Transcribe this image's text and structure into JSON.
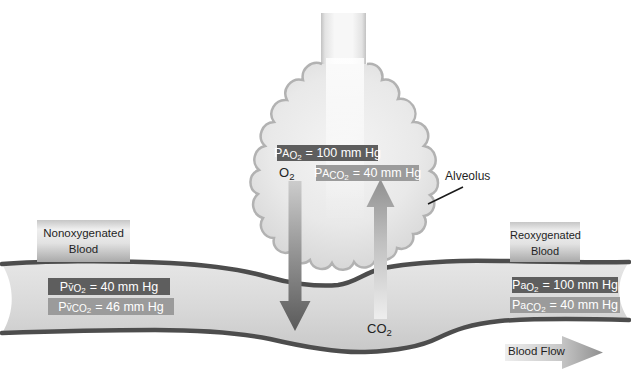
{
  "alveolus": {
    "label": "Alveolus",
    "po2_badge": {
      "p": "P",
      "mod": "A",
      "gas": "O",
      "gas_sub": "2",
      "value": "= 100 mm Hg"
    },
    "pco2_badge": {
      "p": "P",
      "mod": "A",
      "gas": "CO",
      "gas_sub": "2",
      "value": "= 40 mm Hg"
    }
  },
  "gas_labels": {
    "o2": {
      "base": "O",
      "sub": "2"
    },
    "co2": {
      "base": "CO",
      "sub": "2"
    }
  },
  "venous_side": {
    "title_line1": "Nonoxygenated",
    "title_line2": "Blood",
    "po2_badge": {
      "p": "P",
      "mod": "v̄",
      "gas": "O",
      "gas_sub": "2",
      "value": "= 40 mm Hg"
    },
    "pco2_badge": {
      "p": "P",
      "mod": "v̄",
      "gas": "CO",
      "gas_sub": "2",
      "value": "= 46 mm Hg"
    }
  },
  "arterial_side": {
    "title_line1": "Reoxygenated",
    "title_line2": "Blood",
    "po2_badge": {
      "p": "P",
      "mod": "a",
      "gas": "O",
      "gas_sub": "2",
      "value": "= 100 mm Hg"
    },
    "pco2_badge": {
      "p": "P",
      "mod": "a",
      "gas": "CO",
      "gas_sub": "2",
      "value": "= 40 mm Hg"
    }
  },
  "flow_label": "Blood Flow",
  "colors": {
    "badge_dark": "#5e5e5e",
    "badge_medium": "#9b9b9b",
    "badge_text": "#ffffff",
    "vessel_wall": "#4d4d4d",
    "alveolus_outline": "#b2b2b2",
    "text_dark": "#1f1f1f"
  }
}
